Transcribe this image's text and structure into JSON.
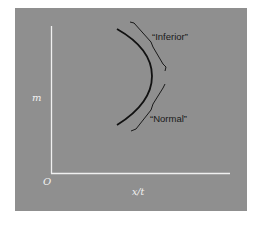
{
  "figure": {
    "background_color": "#8f8f8f",
    "axis_color": "#f0f0f0",
    "curve_color": "#111111",
    "axes": {
      "x_label": "x/t",
      "y_label": "m",
      "origin_label": "O"
    },
    "annotations": [
      {
        "id": "inferior",
        "label": "“Inferior”"
      },
      {
        "id": "normal",
        "label": "“Normal”"
      }
    ],
    "curve": {
      "description": "Backward-bending curve: m rises with x/t along the lower 'Normal' branch, then x/t decreases as m continues to rise along the upper 'Inferior' branch"
    }
  }
}
